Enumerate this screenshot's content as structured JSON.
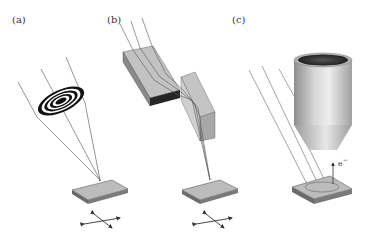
{
  "panels": [
    {
      "id": "a",
      "label": "(a)",
      "description": "Fresnel zone plate focusing rays onto sample",
      "elements": [
        "zone-plate",
        "incident-rays",
        "sample-stage",
        "xy-scan-arrows"
      ]
    },
    {
      "id": "b",
      "label": "(b)",
      "description": "Kirkpatrick-Baez mirror pair focusing rays onto sample",
      "elements": [
        "horizontal-mirror",
        "vertical-mirror",
        "incident-rays",
        "sample-stage",
        "xy-scan-arrows"
      ]
    },
    {
      "id": "c",
      "label": "(c)",
      "description": "Full-field illumination with electron detector collecting photoelectrons",
      "elements": [
        "electron-optics-column",
        "incident-rays",
        "sample-stage",
        "illuminated-area"
      ]
    }
  ],
  "annotations": {
    "electron_label": "e",
    "electron_superscript": "−"
  },
  "colors": {
    "background": "#ffffff",
    "ray": "#555555",
    "stage_top": "#b8b8b8",
    "stage_side": "#6a6a6a",
    "mirror_top": "#bdbdbd",
    "mirror_dark": "#2a2a2a",
    "column": "#c8c8c8"
  }
}
